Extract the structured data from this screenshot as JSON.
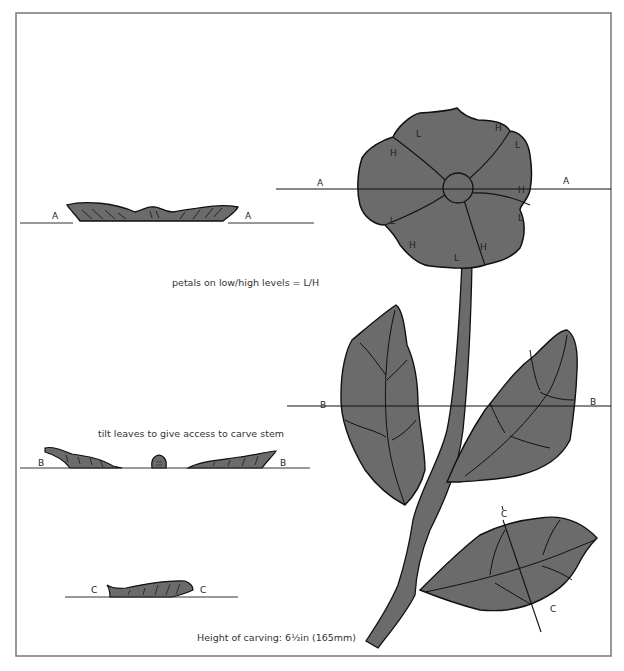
{
  "diagram": {
    "title": "",
    "fill_color": "#6b6b6b",
    "stroke_color": "#111111",
    "frame_color": "#777777",
    "captions": {
      "petals": "petals on low/high levels = L/H",
      "leaves": "tilt leaves to give access to carve stem",
      "height": "Height of carving: 6½in (165mm)"
    },
    "section_labels": {
      "a_left": "A",
      "a_right": "A",
      "b_left": "B",
      "b_right": "B",
      "c_left": "C",
      "c_right": "C",
      "flower_a_left": "A",
      "flower_a_right": "A",
      "leaf_b_left": "B",
      "leaf_b_right": "B",
      "leaf_c_top": "C",
      "leaf_c_bottom": "C"
    },
    "petal_levels": [
      {
        "label": "L"
      },
      {
        "label": "H"
      },
      {
        "label": "L"
      },
      {
        "label": "H"
      },
      {
        "label": "L"
      },
      {
        "label": "H"
      },
      {
        "label": "L"
      },
      {
        "label": "H"
      },
      {
        "label": "L"
      },
      {
        "label": "H"
      },
      {
        "label": "L"
      }
    ],
    "cross_sections": [
      {
        "id": "A",
        "description": "section through flower"
      },
      {
        "id": "B",
        "description": "section through upper leaves and stem"
      },
      {
        "id": "C",
        "description": "section through lower leaf"
      }
    ]
  }
}
